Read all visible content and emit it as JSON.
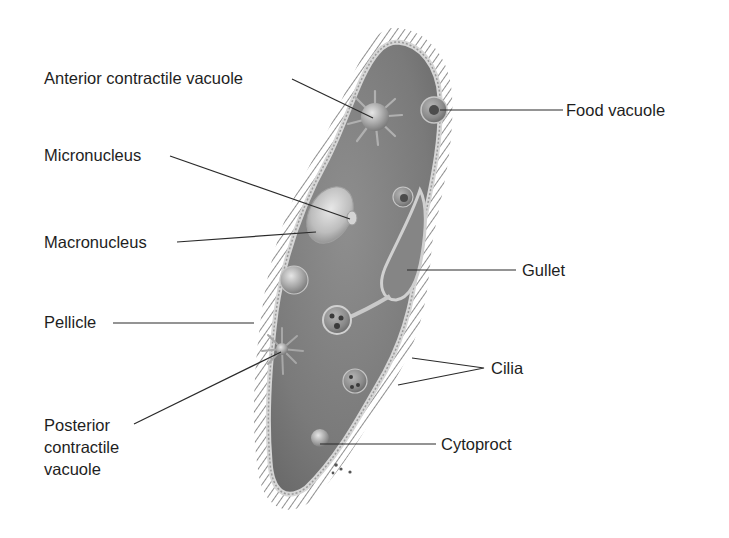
{
  "diagram": {
    "colors": {
      "background": "#ffffff",
      "cytoplasm": "#7d7d7d",
      "cilia": "#6e6e6e",
      "pellicle": "#c8c8c8",
      "leader_line": "#2a2a2a",
      "label_text": "#1e1e1e"
    },
    "labels": {
      "anterior_contractile_vacuole": "Anterior contractile vacuole",
      "micronucleus": "Micronucleus",
      "macronucleus": "Macronucleus",
      "pellicle": "Pellicle",
      "posterior_contractile_vacuole": "Posterior\ncontractile\nvacuole",
      "food_vacuole": "Food vacuole",
      "gullet": "Gullet",
      "cilia": "Cilia",
      "cytoproct": "Cytoproct"
    }
  }
}
